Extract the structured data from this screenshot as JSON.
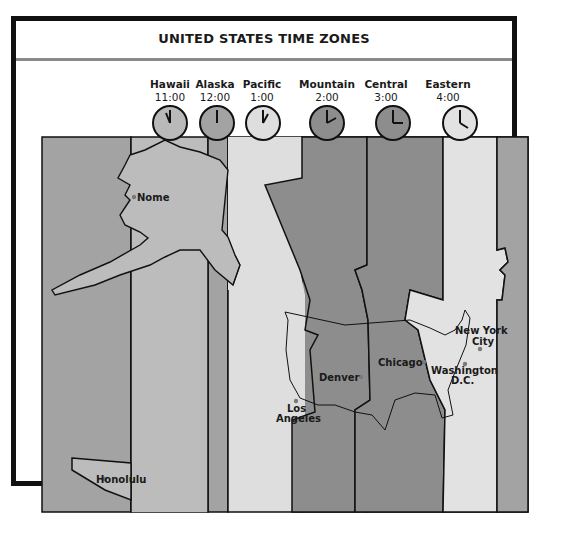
{
  "title": "UNITED STATES TIME ZONES",
  "zones": [
    {
      "name": "Hawaii",
      "time": "11:00",
      "hour_angle": 330,
      "minute_angle": 0,
      "color": "#b9b9b9"
    },
    {
      "name": "Alaska",
      "time": "12:00",
      "hour_angle": 0,
      "minute_angle": 0,
      "color": "#a3a3a3"
    },
    {
      "name": "Pacific",
      "time": "1:00",
      "hour_angle": 30,
      "minute_angle": 0,
      "color": "#dedede"
    },
    {
      "name": "Mountain",
      "time": "2:00",
      "hour_angle": 60,
      "minute_angle": 0,
      "color": "#8d8d8d"
    },
    {
      "name": "Central",
      "time": "3:00",
      "hour_angle": 90,
      "minute_angle": 0,
      "color": "#8d8d8d"
    },
    {
      "name": "Eastern",
      "time": "4:00",
      "hour_angle": 120,
      "minute_angle": 0,
      "color": "#e2e2e2"
    }
  ],
  "cities": [
    {
      "name": "Nome"
    },
    {
      "name": "Honolulu"
    },
    {
      "name": "Los",
      "name2": "Angeles"
    },
    {
      "name": "Denver"
    },
    {
      "name": "Chicago"
    },
    {
      "name": "New York",
      "name2": "City"
    },
    {
      "name": "Washington",
      "name2": "D.C."
    }
  ],
  "colors": {
    "band_dark": "#8d8d8d",
    "band_mid": "#a3a3a3",
    "band_light": "#bcbcbc",
    "band_pale": "#dedede",
    "border": "#111111",
    "rule": "#8a8a8a",
    "city_dot": "#7a7a7a"
  }
}
